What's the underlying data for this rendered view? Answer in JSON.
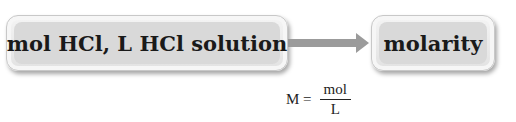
{
  "diagram": {
    "source_box": {
      "label": "mol HCl, L HCl solution"
    },
    "target_box": {
      "label": "molarity"
    },
    "arrow": {
      "direction": "right",
      "color": "#9b9b9b"
    },
    "formula": {
      "lhs": "M =",
      "numerator": "mol",
      "denominator": "L"
    }
  }
}
